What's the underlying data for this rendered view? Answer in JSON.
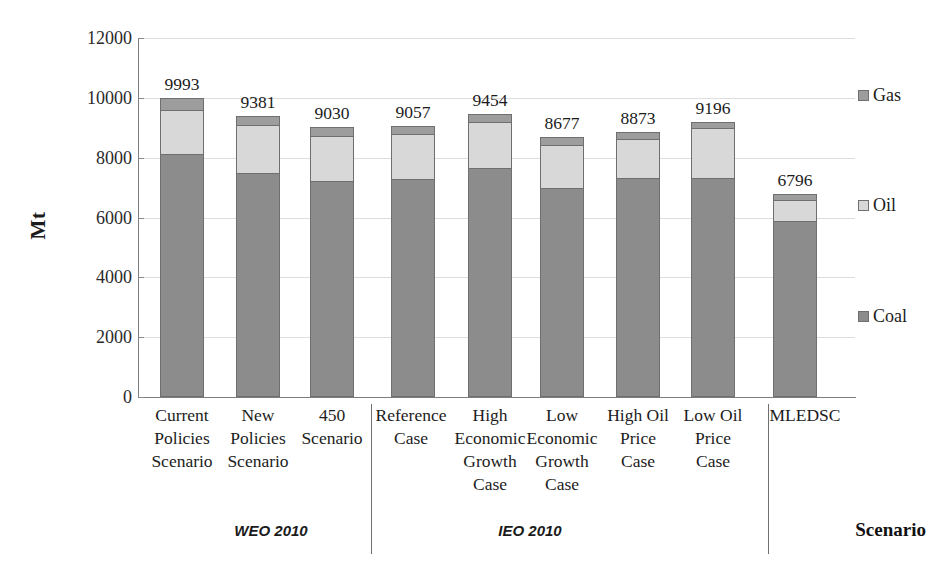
{
  "chart_data": {
    "type": "bar",
    "subtype": "stacked-column",
    "title": "",
    "xlabel": "Scenario",
    "ylabel": "Mt",
    "ylim": [
      0,
      12000
    ],
    "yticks": [
      0,
      2000,
      4000,
      6000,
      8000,
      10000,
      12000
    ],
    "ytick_labels": [
      "0",
      "2000",
      "4000",
      "6000",
      "8000",
      "10000",
      "12000"
    ],
    "grid": true,
    "legend_position": "right",
    "categories": [
      "Current Policies Scenario",
      "New Policies Scenario",
      "450 Scenario",
      "Reference Case",
      "High Economic Growth Case",
      "Low Economic Growth Case",
      "High Oil Price Case",
      "Low Oil Price Case",
      "MLEDSC"
    ],
    "category_label_lines": [
      [
        "Current",
        "Policies",
        "Scenario"
      ],
      [
        "New",
        "Policies",
        "Scenario"
      ],
      [
        "450",
        "Scenario"
      ],
      [
        "Reference",
        "Case"
      ],
      [
        "High",
        "Economic",
        "Growth",
        "Case"
      ],
      [
        "Low",
        "Economic",
        "Growth",
        "Case"
      ],
      [
        "High Oil",
        "Price",
        "Case"
      ],
      [
        "Low Oil",
        "Price",
        "Case"
      ],
      [
        "MLEDSC"
      ]
    ],
    "series": [
      {
        "name": "Coal",
        "color": "#8c8c8c",
        "values": [
          8120,
          7500,
          7230,
          7300,
          7650,
          6980,
          7330,
          7330,
          5900
        ]
      },
      {
        "name": "Oil",
        "color": "#d8d8d8",
        "values": [
          1480,
          1580,
          1490,
          1500,
          1550,
          1450,
          1300,
          1670,
          700
        ]
      },
      {
        "name": "Gas",
        "color": "#9d9d9d",
        "values": [
          393,
          301,
          310,
          257,
          254,
          247,
          243,
          196,
          196
        ]
      }
    ],
    "totals": [
      9993,
      9381,
      9030,
      9057,
      9454,
      8677,
      8873,
      9196,
      6796
    ],
    "total_labels": [
      "9993",
      "9381",
      "9030",
      "9057",
      "9454",
      "8677",
      "8873",
      "9196",
      "6796"
    ],
    "groups": [
      {
        "label": "WEO 2010",
        "categories": [
          "Current Policies Scenario",
          "New Policies Scenario",
          "450 Scenario"
        ]
      },
      {
        "label": "IEO 2010",
        "categories": [
          "Reference Case",
          "High Economic Growth Case",
          "Low Economic Growth Case",
          "High Oil Price Case",
          "Low Oil Price Case"
        ]
      },
      {
        "label": "",
        "categories": [
          "MLEDSC"
        ]
      }
    ],
    "legend": [
      {
        "label": "Gas",
        "color": "#9d9d9d"
      },
      {
        "label": "Oil",
        "color": "#d8d8d8"
      },
      {
        "label": "Coal",
        "color": "#8c8c8c"
      }
    ]
  }
}
